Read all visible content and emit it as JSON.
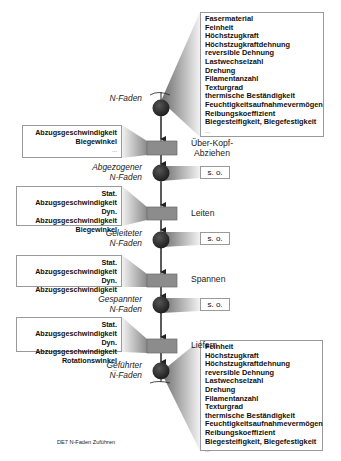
{
  "diagram": {
    "caption": "DE7 N-Faden Zuführen",
    "colors": {
      "node": "#2a2a2a",
      "process": "#8c8c8c",
      "border": "#9a9a9a"
    },
    "top_properties": {
      "items": [
        "Fasermaterial",
        "Feinheit",
        "Höchstzugkraft",
        "Höchstzugkraftdehnung",
        "reversible Dehnung",
        "Lastwechselzahl",
        "Drehung",
        "Filamentanzahl",
        "Texturgrad",
        "thermische Beständigkeit",
        "Feuchtigkeitsaufnahmevermögen",
        "Reibungskoeffizient",
        "Biegesteifigkeit, Biegefestigkeit"
      ],
      "more": "..."
    },
    "bottom_properties": {
      "items": [
        "Feinheit",
        "Höchstzugkraft",
        "Höchstzugkraftdehnung",
        "reversible Dehnung",
        "Lastwechselzahl",
        "Drehung",
        "Filamentanzahl",
        "Texturgrad",
        "thermische Beständigkeit",
        "Feuchtigkeitsaufnahmevermögen",
        "Reibungskoeffizient",
        "Biegesteifigkeit, Biegefestigkeit"
      ],
      "more": "..."
    },
    "states": [
      {
        "line1": "",
        "line2": "N-Faden"
      },
      {
        "line1": "Abgezogener",
        "line2": "N-Faden"
      },
      {
        "line1": "Geleiteter",
        "line2": "N-Faden"
      },
      {
        "line1": "Gespannter",
        "line2": "N-Faden"
      },
      {
        "line1": "Geführter",
        "line2": "N-Faden"
      }
    ],
    "so_label": "s. o.",
    "processes": [
      {
        "line1": "Über-Kopf-",
        "line2": "Abziehen",
        "params": [
          "Abzugsgeschwindigkeit",
          "Biegewinkel"
        ],
        "more": "..."
      },
      {
        "line1": "Leiten",
        "line2": "",
        "params": [
          "Stat. Abzugsgeschwindigkeit",
          "Dyn. Abzugsgeschwindigkeit",
          "Biegewinkel"
        ],
        "more": "..."
      },
      {
        "line1": "Spannen",
        "line2": "",
        "params": [
          "Stat. Abzugsgeschwindigkeit",
          "Dyn. Abzugsgeschwindigkeit"
        ],
        "more": "..."
      },
      {
        "line1": "Liefern",
        "line2": "",
        "params": [
          "Stat. Abzugsgeschwindigkeit",
          "Dyn. Abzugsgeschwindigkeit",
          "Rotationswinkel"
        ],
        "more": "..."
      }
    ]
  }
}
